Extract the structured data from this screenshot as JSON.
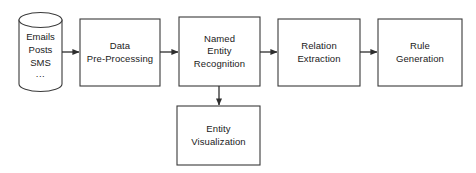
{
  "diagram": {
    "background_color": "#ffffff",
    "stroke_color": "#3a3a3a",
    "text_color": "#1a1a1a",
    "datastore": {
      "name": "data-sources-datastore",
      "lines": [
        "Emails",
        "Posts",
        "SMS"
      ],
      "ellipsis": "...",
      "line1": "Emails",
      "line2": "Posts",
      "line3": "SMS"
    },
    "nodes": [
      {
        "id": "data-preprocessing",
        "label": "Data\nPre-Processing"
      },
      {
        "id": "named-entity-recognition",
        "label": "Named\nEntity\nRecognition"
      },
      {
        "id": "relation-extraction",
        "label": "Relation\nExtraction"
      },
      {
        "id": "rule-generation",
        "label": "Rule\nGeneration"
      },
      {
        "id": "entity-visualization",
        "label": "Entity\nVisualization"
      }
    ],
    "edges": [
      {
        "id": "edge-datastore-to-preprocessing",
        "from": "data-sources-datastore",
        "to": "data-preprocessing",
        "direction": "right"
      },
      {
        "id": "edge-preprocessing-to-ner",
        "from": "data-preprocessing",
        "to": "named-entity-recognition",
        "direction": "right"
      },
      {
        "id": "edge-ner-to-relation",
        "from": "named-entity-recognition",
        "to": "relation-extraction",
        "direction": "right"
      },
      {
        "id": "edge-relation-to-rule",
        "from": "relation-extraction",
        "to": "rule-generation",
        "direction": "right"
      },
      {
        "id": "edge-ner-to-visualization",
        "from": "named-entity-recognition",
        "to": "entity-visualization",
        "direction": "down"
      }
    ]
  }
}
